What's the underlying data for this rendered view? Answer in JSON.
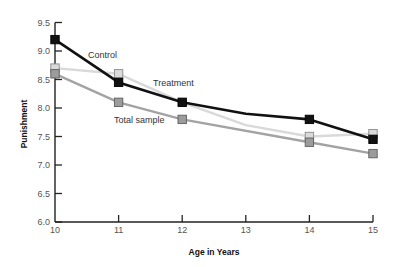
{
  "chart_data": {
    "type": "line",
    "title": "",
    "xlabel": "Age in Years",
    "ylabel": "Punishment",
    "x": [
      10,
      11,
      12,
      13,
      14,
      15
    ],
    "x_ticks": [
      "10",
      "11",
      "12",
      "13",
      "14",
      "15"
    ],
    "y_ticks": [
      "6.0",
      "6.5",
      "7.0",
      "7.5",
      "8.0",
      "8.5",
      "9.0",
      "9.5"
    ],
    "xlim": [
      10,
      15
    ],
    "ylim": [
      6.0,
      9.5
    ],
    "grid": false,
    "legend": "inline labels",
    "series": [
      {
        "name": "Control",
        "color": "#111111",
        "marker_fill": "#111111",
        "marker_stroke": "#000000",
        "points": [
          {
            "x": 10,
            "y": 9.2,
            "marker": true
          },
          {
            "x": 11,
            "y": 8.45,
            "marker": true
          },
          {
            "x": 12,
            "y": 8.1,
            "marker": true
          },
          {
            "x": 13,
            "y": 7.9,
            "marker": false
          },
          {
            "x": 14,
            "y": 7.8,
            "marker": true
          },
          {
            "x": 15,
            "y": 7.45,
            "marker": true
          }
        ],
        "label_pos": {
          "x": 88,
          "y": 58
        }
      },
      {
        "name": "Treatment",
        "color": "#d9d9d9",
        "marker_fill": "#dadada",
        "marker_stroke": "#8a8a8a",
        "points": [
          {
            "x": 10,
            "y": 8.7,
            "marker": true
          },
          {
            "x": 11,
            "y": 8.6,
            "marker": true
          },
          {
            "x": 12,
            "y": 8.1,
            "marker": false
          },
          {
            "x": 13,
            "y": 7.7,
            "marker": false
          },
          {
            "x": 14,
            "y": 7.5,
            "marker": true
          },
          {
            "x": 15,
            "y": 7.55,
            "marker": true
          }
        ],
        "label_pos": {
          "x": 153,
          "y": 86
        }
      },
      {
        "name": "Total sample",
        "color": "#a3a3a3",
        "marker_fill": "#9c9c9c",
        "marker_stroke": "#5e5e5e",
        "points": [
          {
            "x": 10,
            "y": 8.6,
            "marker": true
          },
          {
            "x": 11,
            "y": 8.1,
            "marker": true
          },
          {
            "x": 12,
            "y": 7.8,
            "marker": true
          },
          {
            "x": 14,
            "y": 7.4,
            "marker": true
          },
          {
            "x": 15,
            "y": 7.2,
            "marker": true
          }
        ],
        "label_pos": {
          "x": 114,
          "y": 123
        }
      }
    ]
  },
  "layout": {
    "plot_left": 55,
    "plot_right": 373,
    "plot_top": 22.5,
    "plot_bottom": 222
  }
}
